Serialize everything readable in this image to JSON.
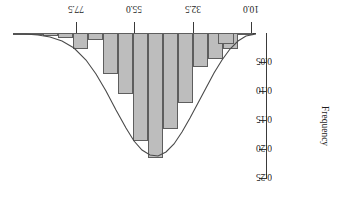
{
  "chart_data": {
    "type": "bar",
    "title": "",
    "subtitle": "",
    "orientation": "inverted-180",
    "xlabel": "",
    "ylabel": "Frequency",
    "xlim": [
      88.75,
      3.75
    ],
    "ylim": [
      0.0,
      0.25
    ],
    "grid": false,
    "legend": null,
    "xticks": [
      {
        "value": "77.5",
        "pos": 76
      },
      {
        "value": "55.0",
        "pos": 134
      },
      {
        "value": "32.5",
        "pos": 193
      },
      {
        "value": "10.0",
        "pos": 251
      }
    ],
    "yticks": [
      {
        "value": "0.05",
        "pos": 62
      },
      {
        "value": "0.10",
        "pos": 91
      },
      {
        "value": "0.15",
        "pos": 120
      },
      {
        "value": "0.20",
        "pos": 149
      },
      {
        "value": "0.25",
        "pos": 178
      }
    ],
    "bar_fill_color": "#bdbdbd",
    "bar_edge_color": "#5e5e5e",
    "curve_color": "#4a4a4a",
    "axis_color": "#3a3a3a",
    "bin_width": 5.0,
    "categories": [
      "86.25",
      "81.25",
      "76.25",
      "71.25",
      "66.25",
      "61.25",
      "56.25",
      "51.25",
      "46.25",
      "41.25",
      "36.25",
      "31.25",
      "26.25",
      "21.25",
      "16.25",
      "11.25",
      "6.25"
    ],
    "values": [
      0.002,
      0.004,
      0.006,
      0.008,
      0.028,
      0.012,
      0.07,
      0.105,
      0.185,
      0.215,
      0.165,
      0.12,
      0.058,
      0.045,
      0.028,
      0.002,
      0.018
    ],
    "bars_px": [
      {
        "x": 13,
        "w": 15,
        "h": 1
      },
      {
        "x": 28,
        "w": 15,
        "h": 2
      },
      {
        "x": 43,
        "w": 15,
        "h": 3
      },
      {
        "x": 58,
        "w": 15,
        "h": 5
      },
      {
        "x": 73,
        "w": 15,
        "h": 16
      },
      {
        "x": 88,
        "w": 15,
        "h": 7
      },
      {
        "x": 103,
        "w": 15,
        "h": 41
      },
      {
        "x": 118,
        "w": 15,
        "h": 61
      },
      {
        "x": 133,
        "w": 15,
        "h": 108
      },
      {
        "x": 148,
        "w": 15,
        "h": 125
      },
      {
        "x": 163,
        "w": 15,
        "h": 96
      },
      {
        "x": 178,
        "w": 15,
        "h": 70
      },
      {
        "x": 193,
        "w": 15,
        "h": 34
      },
      {
        "x": 208,
        "w": 15,
        "h": 26
      },
      {
        "x": 223,
        "w": 15,
        "h": 16
      },
      {
        "x": 238,
        "w": 15,
        "h": 1
      },
      {
        "x": 218,
        "w": 16,
        "h": 11
      }
    ],
    "curve_points": [
      [
        13,
        34
      ],
      [
        25,
        34
      ],
      [
        38,
        35
      ],
      [
        50,
        37
      ],
      [
        62,
        41
      ],
      [
        74,
        48
      ],
      [
        86,
        60
      ],
      [
        96,
        74
      ],
      [
        106,
        91
      ],
      [
        116,
        110
      ],
      [
        126,
        128
      ],
      [
        134,
        141
      ],
      [
        142,
        150
      ],
      [
        150,
        155
      ],
      [
        158,
        156
      ],
      [
        166,
        152
      ],
      [
        174,
        144
      ],
      [
        182,
        132
      ],
      [
        190,
        118
      ],
      [
        198,
        103
      ],
      [
        206,
        88
      ],
      [
        214,
        73
      ],
      [
        222,
        60
      ],
      [
        230,
        49
      ],
      [
        238,
        41
      ],
      [
        246,
        36
      ],
      [
        256,
        34
      ]
    ],
    "annotations": []
  },
  "axis": {
    "y_title": "Frequency"
  }
}
